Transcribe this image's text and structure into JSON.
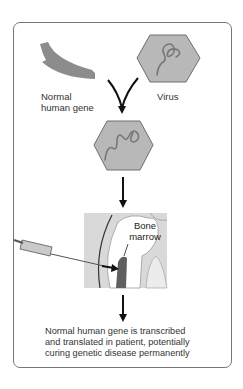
{
  "diagram": {
    "nodes": {
      "gene": {
        "label_line1": "Normal",
        "label_line2": "human gene"
      },
      "virus": {
        "label": "Virus"
      },
      "recombinant_virus": {
        "label": ""
      },
      "bone_marrow": {
        "label_line1": "Bone",
        "label_line2": "marrow"
      }
    },
    "caption": {
      "line1": "Normal human gene is transcribed",
      "line2": "and translated in patient, potentially",
      "line3": "curing genetic disease permanently"
    },
    "colors": {
      "frame_border": "#777777",
      "gene_fill": "#8c8c8c",
      "hexagon_fill": "#b8b8b8",
      "hexagon_stroke": "#6e6e6e",
      "strand": "#777777",
      "arrow": "#111111",
      "bone_bg": "#d9d9d9",
      "marrow": "#5f5f5f"
    }
  }
}
